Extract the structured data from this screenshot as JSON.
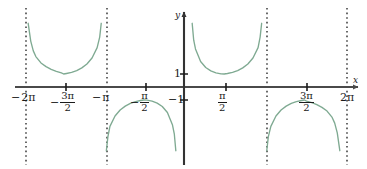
{
  "figure": {
    "kind": "math-function-graph",
    "function_label": "y = sec(x)",
    "background_color": "#ffffff",
    "curve_color": "#7faa92",
    "axis_color": "#4a4a4a",
    "asymptote_color": "#2b2b2b",
    "text_color": "#1b1b1b",
    "width": 367,
    "height": 169
  },
  "axes": {
    "x_axis_name": "x",
    "y_axis_name": "y",
    "x_axis_pixel_y": 87,
    "y_axis_pixel_x": 184,
    "x_pixel_min": 15,
    "x_pixel_max": 358,
    "y_pixel_top": 12,
    "y_pixel_bottom": 165
  },
  "x_ticks": [
    {
      "value": -6.2832,
      "label_parts": {
        "sign": "−",
        "whole": "2π"
      },
      "type": "whole",
      "pixel_x": 26
    },
    {
      "value": -4.7124,
      "label_parts": {
        "sign": "−",
        "num": "3π",
        "den": "2"
      },
      "type": "fraction",
      "pixel_x": 66
    },
    {
      "value": -3.1416,
      "label_parts": {
        "sign": "−",
        "whole": "π"
      },
      "type": "whole",
      "pixel_x": 107
    },
    {
      "value": -1.5708,
      "label_parts": {
        "sign": "−",
        "num": "π",
        "den": "2"
      },
      "type": "fraction",
      "pixel_x": 146
    },
    {
      "value": 1.5708,
      "label_parts": {
        "sign": "",
        "num": "π",
        "den": "2"
      },
      "type": "fraction",
      "pixel_x": 226
    },
    {
      "value": 4.7124,
      "label_parts": {
        "sign": "",
        "num": "3π",
        "den": "2"
      },
      "type": "fraction",
      "pixel_x": 307
    },
    {
      "value": 6.2832,
      "label_parts": {
        "sign": "",
        "whole": "2π"
      },
      "type": "whole",
      "pixel_x": 347
    }
  ],
  "y_ticks": [
    {
      "value": 1,
      "label": "1",
      "pixel_y": 74
    },
    {
      "value": -1,
      "label": "−1",
      "pixel_y": 100
    }
  ],
  "asymptotes": [
    {
      "value": -6.2832,
      "pixel_x": 26
    },
    {
      "value": -3.1416,
      "pixel_x": 107
    },
    {
      "value": 3.1416,
      "pixel_x": 267
    },
    {
      "value": 6.2832,
      "pixel_x": 347
    }
  ],
  "chart_data": {
    "type": "line",
    "title": "",
    "subtitle": "",
    "xlabel": "x",
    "ylabel": "y",
    "grid": false,
    "legend": null,
    "function": "y = sec(x)",
    "xlim": [
      -7.2,
      7.2
    ],
    "ylim": [
      -5.2,
      5.2
    ],
    "x_tick_values": [
      -6.2832,
      -4.7124,
      -3.1416,
      -1.5708,
      1.5708,
      4.7124,
      6.2832
    ],
    "x_tick_labels": [
      "−2π",
      "−3π/2",
      "−π",
      "−π/2",
      "π/2",
      "3π/2",
      "2π"
    ],
    "y_tick_values": [
      1,
      -1
    ],
    "y_tick_labels": [
      "1",
      "−1"
    ],
    "asymptote_x_values": [
      -6.2832,
      -3.1416,
      3.1416,
      6.2832
    ],
    "branches": [
      {
        "name": "branch-left-outer",
        "domain": [
          -6.2832,
          -3.1416
        ],
        "opens": "up",
        "vertex": [
          -4.7124,
          1
        ],
        "points": [
          [
            -6.1,
            4.9
          ],
          [
            -6.0,
            3.53
          ],
          [
            -5.9,
            2.78
          ],
          [
            -5.8,
            2.34
          ],
          [
            -5.6,
            1.85
          ],
          [
            -5.4,
            1.57
          ],
          [
            -5.2,
            1.36
          ],
          [
            -5.0,
            1.2
          ],
          [
            -4.8,
            1.08
          ],
          [
            -4.7124,
            1.0
          ],
          [
            -4.6,
            1.04
          ],
          [
            -4.4,
            1.12
          ],
          [
            -4.2,
            1.26
          ],
          [
            -4.0,
            1.47
          ],
          [
            -3.8,
            1.77
          ],
          [
            -3.6,
            2.23
          ],
          [
            -3.4,
            3.03
          ],
          [
            -3.3,
            3.84
          ],
          [
            -3.24,
            4.9
          ]
        ]
      },
      {
        "name": "branch-left-inner",
        "domain": [
          -3.1416,
          0
        ],
        "opens": "down",
        "vertex": [
          -1.5708,
          -1
        ],
        "points": [
          [
            -3.04,
            -4.9
          ],
          [
            -2.98,
            -3.84
          ],
          [
            -2.9,
            -3.03
          ],
          [
            -2.7,
            -2.23
          ],
          [
            -2.5,
            -1.77
          ],
          [
            -2.3,
            -1.47
          ],
          [
            -2.1,
            -1.26
          ],
          [
            -1.9,
            -1.12
          ],
          [
            -1.7,
            -1.04
          ],
          [
            -1.5708,
            -1.0
          ],
          [
            -1.45,
            -1.01
          ],
          [
            -1.25,
            -1.09
          ],
          [
            -1.05,
            -1.24
          ],
          [
            -0.85,
            -1.5
          ],
          [
            -0.65,
            -1.96
          ],
          [
            -0.45,
            -2.93
          ],
          [
            -0.38,
            -3.6
          ],
          [
            -0.32,
            -4.9
          ]
        ]
      },
      {
        "name": "branch-right-inner",
        "domain": [
          0,
          3.1416
        ],
        "opens": "up",
        "vertex": [
          1.5708,
          1
        ],
        "points": [
          [
            0.32,
            4.9
          ],
          [
            0.38,
            3.6
          ],
          [
            0.45,
            2.93
          ],
          [
            0.65,
            1.96
          ],
          [
            0.85,
            1.5
          ],
          [
            1.05,
            1.24
          ],
          [
            1.25,
            1.09
          ],
          [
            1.45,
            1.01
          ],
          [
            1.5708,
            1.0
          ],
          [
            1.7,
            1.04
          ],
          [
            1.9,
            1.12
          ],
          [
            2.1,
            1.26
          ],
          [
            2.3,
            1.47
          ],
          [
            2.5,
            1.77
          ],
          [
            2.7,
            2.23
          ],
          [
            2.9,
            3.03
          ],
          [
            2.98,
            3.84
          ],
          [
            3.04,
            4.9
          ]
        ]
      },
      {
        "name": "branch-right-outer",
        "domain": [
          3.1416,
          6.2832
        ],
        "opens": "down",
        "vertex": [
          4.7124,
          -1
        ],
        "points": [
          [
            3.24,
            -4.9
          ],
          [
            3.3,
            -3.84
          ],
          [
            3.4,
            -3.03
          ],
          [
            3.6,
            -2.23
          ],
          [
            3.8,
            -1.77
          ],
          [
            4.0,
            -1.47
          ],
          [
            4.2,
            -1.26
          ],
          [
            4.4,
            -1.12
          ],
          [
            4.6,
            -1.04
          ],
          [
            4.7124,
            -1.0
          ],
          [
            4.8,
            -1.08
          ],
          [
            5.0,
            -1.2
          ],
          [
            5.2,
            -1.36
          ],
          [
            5.4,
            -1.57
          ],
          [
            5.6,
            -1.85
          ],
          [
            5.8,
            -2.34
          ],
          [
            5.9,
            -2.78
          ],
          [
            6.0,
            -3.53
          ],
          [
            6.1,
            -4.9
          ]
        ]
      }
    ]
  }
}
